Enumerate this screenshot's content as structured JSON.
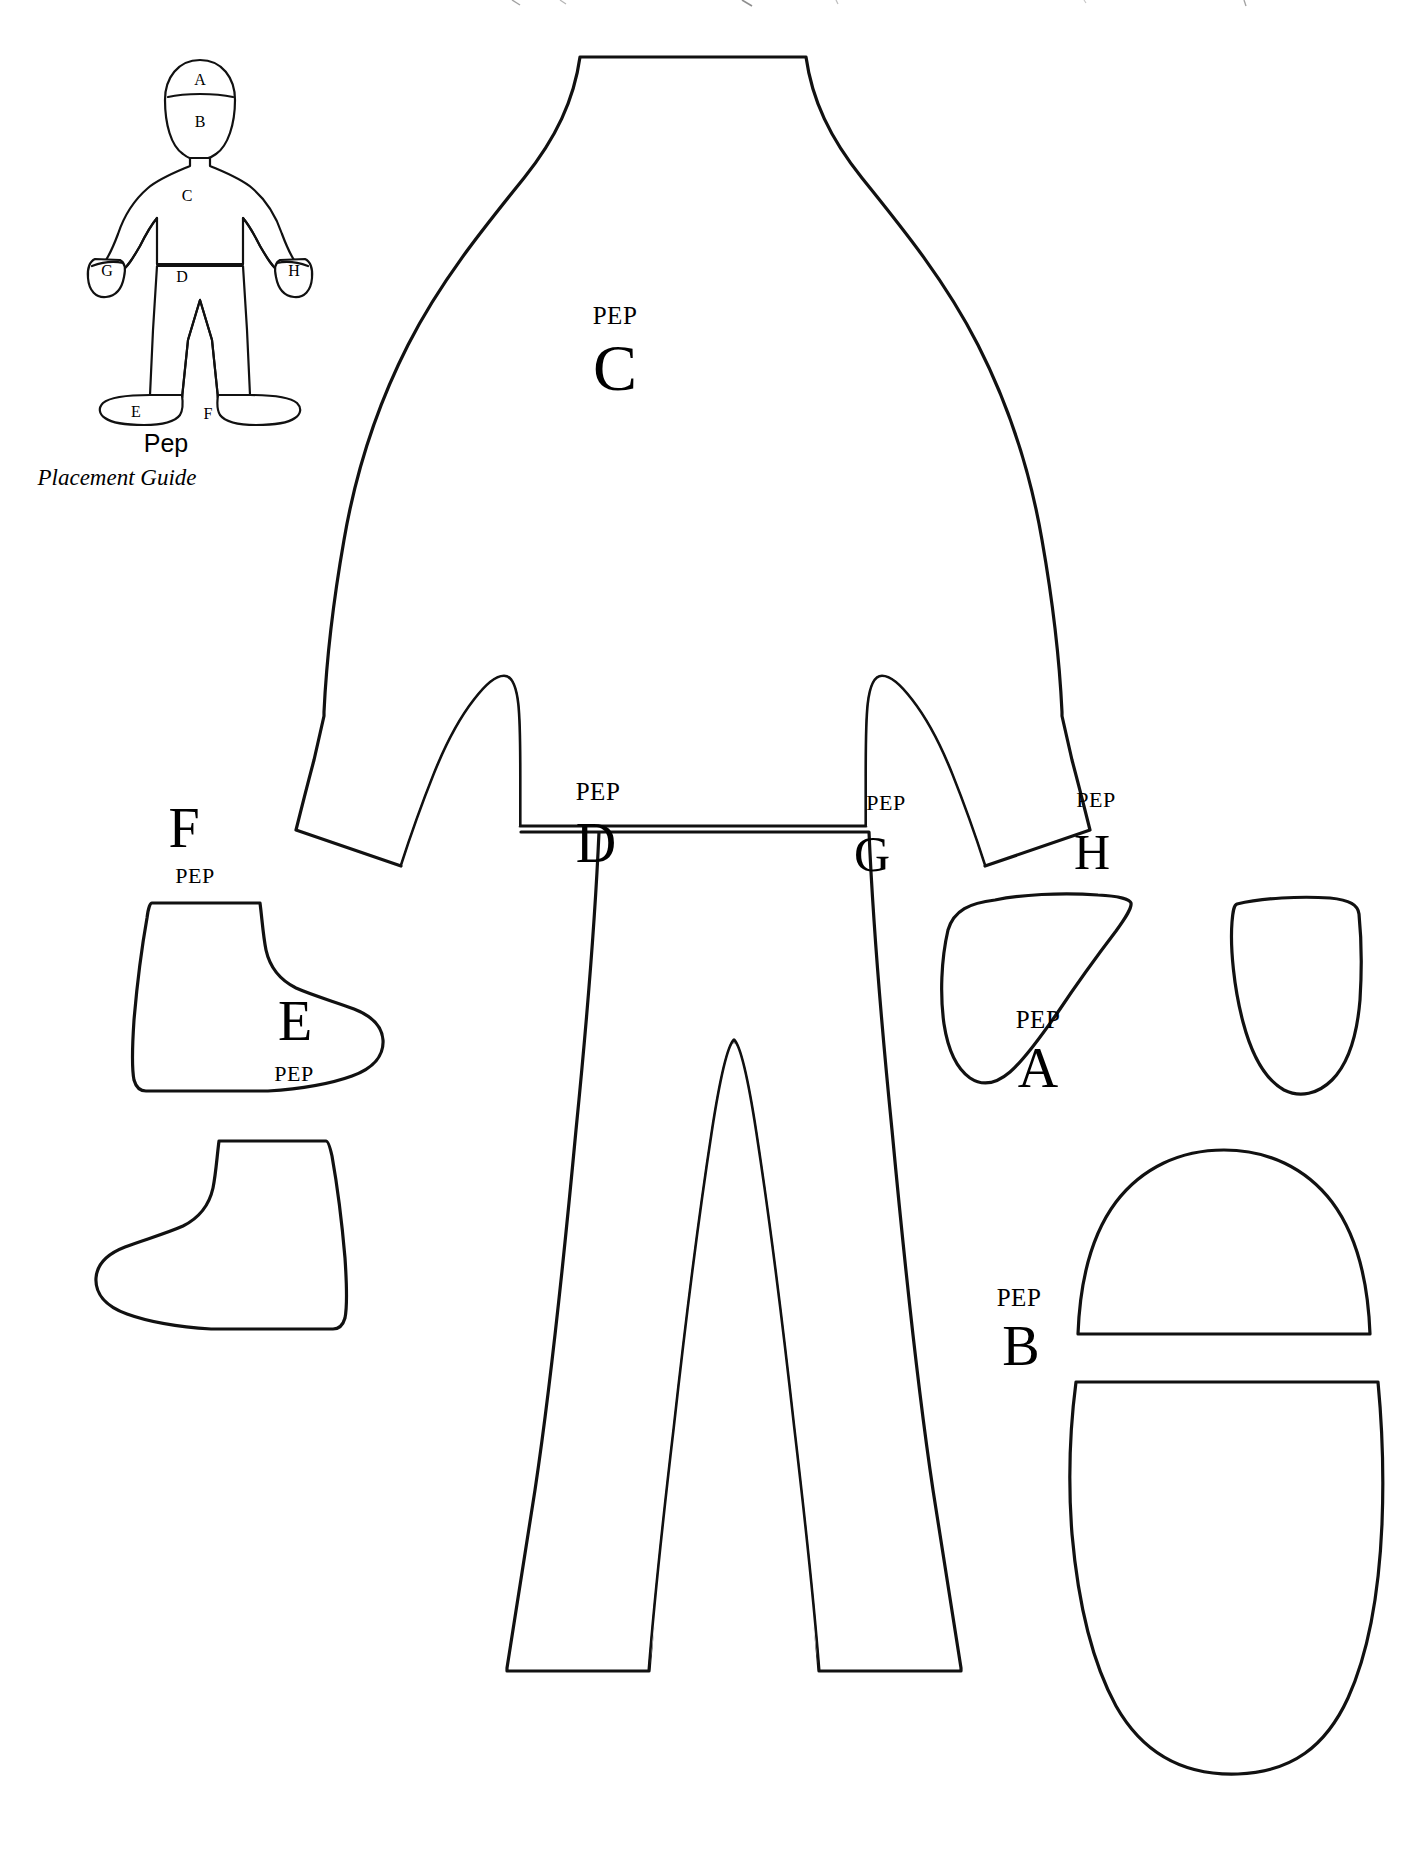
{
  "document": {
    "type": "sewing-pattern-template",
    "subject_name": "Pep",
    "pattern_prefix": "PEP",
    "background_color": "#ffffff",
    "ink_color": "#111111"
  },
  "placement_guide": {
    "title": "Pep",
    "subtitle": "Placement Guide",
    "labels": [
      {
        "id": "A",
        "text": "A"
      },
      {
        "id": "B",
        "text": "B"
      },
      {
        "id": "C",
        "text": "C"
      },
      {
        "id": "D",
        "text": "D"
      },
      {
        "id": "E",
        "text": "E"
      },
      {
        "id": "F",
        "text": "F"
      },
      {
        "id": "G",
        "text": "G"
      },
      {
        "id": "H",
        "text": "H"
      }
    ]
  },
  "pattern_pieces": [
    {
      "id": "C",
      "name": "body-jacket-piece",
      "prefix": "PEP",
      "letter": "C",
      "description": "torso with sleeves"
    },
    {
      "id": "D",
      "name": "pants-piece",
      "prefix": "PEP",
      "letter": "D",
      "description": "trousers"
    },
    {
      "id": "F",
      "name": "shoe-right-piece",
      "prefix": "PEP",
      "letter": "F",
      "description": "shoe facing right"
    },
    {
      "id": "E",
      "name": "shoe-left-piece",
      "prefix": "PEP",
      "letter": "E",
      "description": "shoe facing left"
    },
    {
      "id": "G",
      "name": "hand-left-piece",
      "prefix": "PEP",
      "letter": "G",
      "description": "left mitten hand"
    },
    {
      "id": "H",
      "name": "hand-right-piece",
      "prefix": "PEP",
      "letter": "H",
      "description": "right mitten hand"
    },
    {
      "id": "A",
      "name": "hair-cap-piece",
      "prefix": "PEP",
      "letter": "A",
      "description": "top of head / hair cap"
    },
    {
      "id": "B",
      "name": "face-piece",
      "prefix": "PEP",
      "letter": "B",
      "description": "face oval"
    }
  ]
}
